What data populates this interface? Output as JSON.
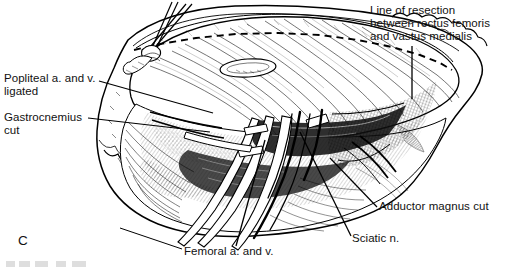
{
  "figure": {
    "letter": "C",
    "type": "surgical-line-illustration",
    "style": "black and white pen-and-ink medical illustration"
  },
  "labels": [
    {
      "id": "popliteal",
      "text": "Popliteal a. and v.\nligated",
      "position": "left-upper",
      "leader": "line from label right edge to popliteal vessels in wound"
    },
    {
      "id": "gastrocnemius",
      "text": "Gastrocnemius\ncut",
      "position": "left-middle",
      "leader": "line from label right edge to cut gastrocnemius muscle"
    },
    {
      "id": "resection",
      "text": "Line of resection\nbetween rectus femoris\nand vastus medialis",
      "position": "right-top",
      "leader": "vertical line down to dashed resection line"
    },
    {
      "id": "adductor",
      "text": "Adductor magnus cut",
      "position": "right-lower",
      "leader": "diagonal line up-left to cut adductor magnus"
    },
    {
      "id": "sciatic",
      "text": "Sciatic n.",
      "position": "bottom-right",
      "leader": "steep line up to sciatic nerve in wound"
    },
    {
      "id": "femoral",
      "text": "Femoral a. and v.",
      "position": "bottom-center",
      "leader": "diagonal line up-right to femoral vessels"
    }
  ],
  "graphic_elements": {
    "dashed_line_name": "resection-dashed-line",
    "skin_edge_name": "scalloped-skin-fat-margin",
    "muscle_belly_name": "rectus-femoris-belly",
    "vessels_name": "vessel-and-nerve-bundle",
    "retractor_name": "retractor-prongs"
  },
  "colors": {
    "ink": "#000000",
    "paper": "#ffffff",
    "shade": "#4a4a4a"
  }
}
